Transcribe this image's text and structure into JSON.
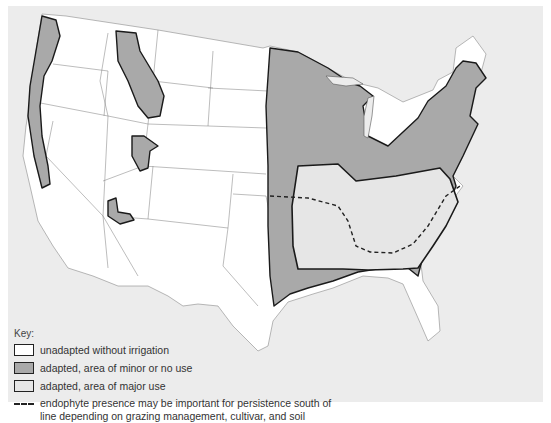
{
  "map": {
    "subject": "Tall fescue adaptation and use areas, United States",
    "colors": {
      "unadapted": "#ffffff",
      "adapted_minor": "#a9a9a9",
      "adapted_major": "#e6e6e6",
      "background": "#ececec",
      "outline": "#1a1a1a"
    }
  },
  "legend": {
    "title": "Key:",
    "items": [
      {
        "label": "unadapted without irrigation",
        "swatch": "#ffffff"
      },
      {
        "label": "adapted, area of minor or no use",
        "swatch": "#a9a9a9"
      },
      {
        "label": "adapted, area of major use",
        "swatch": "#e6e6e6"
      }
    ],
    "dash_line": {
      "line1": "endophyte presence may be important for persistence south of",
      "line2": "line depending on grazing management, cultivar, and soil"
    }
  }
}
